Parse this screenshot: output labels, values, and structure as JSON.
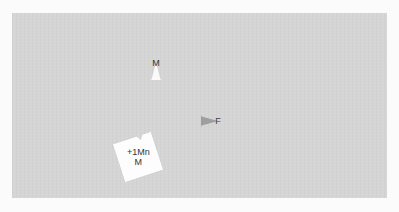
{
  "header": {
    "faint_text": ""
  },
  "board": {
    "color": "#d5d5d5"
  },
  "tokens": [
    {
      "id": "m",
      "label": "M",
      "color": "#fafafa",
      "shape": "circle-with-notch-bottom"
    },
    {
      "id": "f",
      "label": "F",
      "color": "#9e9e9e",
      "shape": "circle-with-notch-left"
    }
  ],
  "card": {
    "line1": "+1Mn",
    "line2": "M",
    "color": "#fdfdfd"
  }
}
